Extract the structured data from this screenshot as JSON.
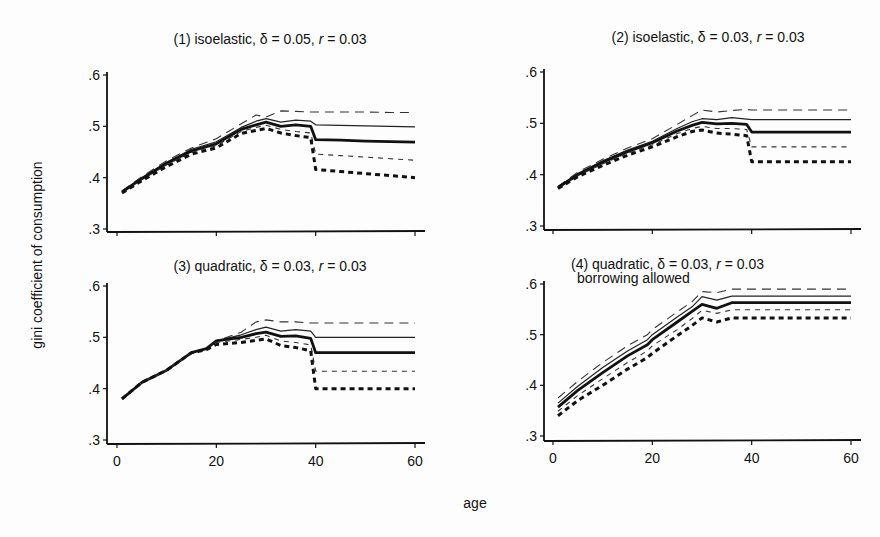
{
  "figure": {
    "ylabel": "gini coefficient of consumption",
    "xlabel": "age"
  },
  "chart_data": [
    {
      "type": "line",
      "title": "(1) isoelastic, δ = 0.05, r = 0.03",
      "title_parts": [
        "(1) isoelastic, δ = 0.05, ",
        "r",
        " = 0.03"
      ],
      "subtitle": "",
      "xlabel": "age",
      "ylabel": "gini coefficient of consumption",
      "xlim": [
        0,
        60
      ],
      "ylim": [
        0.3,
        0.6
      ],
      "xticks": [
        0,
        20,
        40,
        60
      ],
      "xtick_labels": [
        "",
        "",
        "",
        ""
      ],
      "yticks": [
        0.3,
        0.4,
        0.5,
        0.6
      ],
      "ytick_labels": [
        ".3",
        ".4",
        ".5",
        ".6"
      ],
      "grid": false,
      "x": [
        1,
        5,
        10,
        15,
        20,
        25,
        28,
        30,
        33,
        36,
        39,
        40,
        45,
        50,
        55,
        60
      ],
      "series": [
        {
          "name": "upper long dashed",
          "style": "longdash",
          "values": [
            0.374,
            0.402,
            0.433,
            0.458,
            0.476,
            0.505,
            0.522,
            0.518,
            0.53,
            0.529,
            0.528,
            0.528,
            0.528,
            0.528,
            0.527,
            0.527
          ]
        },
        {
          "name": "upper thin solid",
          "style": "thin",
          "values": [
            0.373,
            0.4,
            0.43,
            0.455,
            0.47,
            0.498,
            0.51,
            0.515,
            0.508,
            0.512,
            0.51,
            0.503,
            0.502,
            0.501,
            0.5,
            0.499
          ]
        },
        {
          "name": "median thick solid",
          "style": "thick",
          "values": [
            0.372,
            0.398,
            0.428,
            0.452,
            0.466,
            0.494,
            0.503,
            0.508,
            0.5,
            0.503,
            0.5,
            0.474,
            0.473,
            0.471,
            0.47,
            0.469
          ]
        },
        {
          "name": "lower thin dashed",
          "style": "dash",
          "values": [
            0.371,
            0.396,
            0.425,
            0.449,
            0.462,
            0.49,
            0.498,
            0.502,
            0.494,
            0.49,
            0.487,
            0.446,
            0.443,
            0.44,
            0.437,
            0.434
          ]
        },
        {
          "name": "lower thick dotted",
          "style": "thickdash",
          "values": [
            0.37,
            0.394,
            0.422,
            0.446,
            0.458,
            0.486,
            0.492,
            0.496,
            0.487,
            0.482,
            0.478,
            0.416,
            0.412,
            0.408,
            0.404,
            0.4
          ]
        }
      ]
    },
    {
      "type": "line",
      "title": "(2) isoelastic, δ = 0.03, r = 0.03",
      "title_parts": [
        "(2) isoelastic, δ = 0.03, ",
        "r",
        " = 0.03"
      ],
      "subtitle": "",
      "xlabel": "age",
      "ylabel": "gini coefficient of consumption",
      "xlim": [
        0,
        60
      ],
      "ylim": [
        0.3,
        0.6
      ],
      "xticks": [
        0,
        20,
        40,
        60
      ],
      "xtick_labels": [
        "",
        "",
        "",
        ""
      ],
      "yticks": [
        0.3,
        0.4,
        0.5,
        0.6
      ],
      "ytick_labels": [
        ".3",
        ".4",
        ".5",
        ".6"
      ],
      "grid": false,
      "x": [
        1,
        5,
        10,
        15,
        20,
        25,
        28,
        30,
        33,
        36,
        39,
        40,
        45,
        50,
        55,
        60
      ],
      "series": [
        {
          "name": "upper long dashed",
          "style": "longdash",
          "values": [
            0.377,
            0.405,
            0.43,
            0.452,
            0.47,
            0.498,
            0.515,
            0.526,
            0.522,
            0.525,
            0.527,
            0.526,
            0.526,
            0.526,
            0.526,
            0.526
          ]
        },
        {
          "name": "upper thin solid",
          "style": "thin",
          "values": [
            0.376,
            0.402,
            0.427,
            0.448,
            0.465,
            0.49,
            0.503,
            0.509,
            0.507,
            0.511,
            0.508,
            0.507,
            0.507,
            0.507,
            0.507,
            0.507
          ]
        },
        {
          "name": "median thick solid",
          "style": "thick",
          "values": [
            0.375,
            0.4,
            0.424,
            0.445,
            0.462,
            0.485,
            0.496,
            0.502,
            0.499,
            0.5,
            0.498,
            0.483,
            0.483,
            0.483,
            0.483,
            0.483
          ]
        },
        {
          "name": "lower thin dashed",
          "style": "dash",
          "values": [
            0.374,
            0.398,
            0.421,
            0.442,
            0.458,
            0.48,
            0.49,
            0.494,
            0.49,
            0.49,
            0.488,
            0.454,
            0.454,
            0.454,
            0.454,
            0.454
          ]
        },
        {
          "name": "lower thick dotted",
          "style": "thickdash",
          "values": [
            0.373,
            0.396,
            0.418,
            0.438,
            0.454,
            0.474,
            0.484,
            0.487,
            0.481,
            0.479,
            0.476,
            0.425,
            0.425,
            0.425,
            0.425,
            0.425
          ]
        }
      ]
    },
    {
      "type": "line",
      "title": "(3) quadratic, δ = 0.03, r = 0.03",
      "title_parts": [
        "(3) quadratic, δ = 0.03, ",
        "r",
        " = 0.03"
      ],
      "subtitle": "",
      "xlabel": "age",
      "ylabel": "gini coefficient of consumption",
      "xlim": [
        0,
        60
      ],
      "ylim": [
        0.3,
        0.6
      ],
      "xticks": [
        0,
        20,
        40,
        60
      ],
      "xtick_labels": [
        "0",
        "20",
        "40",
        "60"
      ],
      "yticks": [
        0.3,
        0.4,
        0.5,
        0.6
      ],
      "ytick_labels": [
        ".3",
        ".4",
        ".5",
        ".6"
      ],
      "grid": false,
      "x": [
        1,
        5,
        10,
        15,
        18,
        20,
        25,
        28,
        30,
        33,
        36,
        39,
        40,
        45,
        50,
        55,
        60
      ],
      "series": [
        {
          "name": "upper long dashed",
          "style": "longdash",
          "values": [
            0.38,
            0.412,
            0.436,
            0.47,
            0.478,
            0.493,
            0.51,
            0.53,
            0.534,
            0.53,
            0.53,
            0.528,
            0.528,
            0.528,
            0.528,
            0.528,
            0.528
          ]
        },
        {
          "name": "upper thin solid",
          "style": "thin",
          "values": [
            0.38,
            0.412,
            0.436,
            0.47,
            0.478,
            0.493,
            0.505,
            0.515,
            0.52,
            0.512,
            0.515,
            0.512,
            0.5,
            0.5,
            0.5,
            0.5,
            0.5
          ]
        },
        {
          "name": "median thick solid",
          "style": "thick",
          "values": [
            0.38,
            0.412,
            0.436,
            0.47,
            0.478,
            0.493,
            0.5,
            0.507,
            0.51,
            0.502,
            0.503,
            0.498,
            0.47,
            0.47,
            0.47,
            0.47,
            0.47
          ]
        },
        {
          "name": "lower thin dashed",
          "style": "dash",
          "values": [
            0.38,
            0.412,
            0.436,
            0.47,
            0.478,
            0.49,
            0.496,
            0.5,
            0.504,
            0.493,
            0.49,
            0.485,
            0.434,
            0.434,
            0.434,
            0.434,
            0.434
          ]
        },
        {
          "name": "lower thick dotted",
          "style": "thickdash",
          "values": [
            0.38,
            0.412,
            0.436,
            0.47,
            0.476,
            0.486,
            0.49,
            0.494,
            0.497,
            0.484,
            0.48,
            0.474,
            0.4,
            0.4,
            0.4,
            0.4,
            0.4
          ]
        }
      ]
    },
    {
      "type": "line",
      "title": "(4) quadratic, δ = 0.03, r = 0.03",
      "title_parts": [
        "(4) quadratic, δ = 0.03, ",
        "r",
        " = 0.03"
      ],
      "subtitle": "borrowing allowed",
      "xlabel": "age",
      "ylabel": "gini coefficient of consumption",
      "xlim": [
        0,
        60
      ],
      "ylim": [
        0.3,
        0.6
      ],
      "xticks": [
        0,
        20,
        40,
        60
      ],
      "xtick_labels": [
        "0",
        "20",
        "40",
        "60"
      ],
      "yticks": [
        0.3,
        0.4,
        0.5,
        0.6
      ],
      "ytick_labels": [
        ".3",
        ".4",
        ".5",
        ".6"
      ],
      "grid": false,
      "x": [
        1,
        5,
        10,
        15,
        19,
        20,
        25,
        28,
        30,
        33,
        36,
        40,
        45,
        50,
        55,
        60
      ],
      "series": [
        {
          "name": "upper long dashed",
          "style": "longdash",
          "values": [
            0.375,
            0.408,
            0.445,
            0.478,
            0.5,
            0.51,
            0.545,
            0.565,
            0.585,
            0.583,
            0.59,
            0.59,
            0.59,
            0.59,
            0.59,
            0.59
          ]
        },
        {
          "name": "upper thin solid",
          "style": "thin",
          "values": [
            0.365,
            0.398,
            0.435,
            0.468,
            0.49,
            0.5,
            0.535,
            0.555,
            0.575,
            0.568,
            0.576,
            0.576,
            0.576,
            0.576,
            0.576,
            0.576
          ]
        },
        {
          "name": "median thick solid",
          "style": "thick",
          "values": [
            0.357,
            0.39,
            0.425,
            0.458,
            0.48,
            0.49,
            0.525,
            0.546,
            0.56,
            0.552,
            0.563,
            0.563,
            0.563,
            0.563,
            0.563,
            0.563
          ]
        },
        {
          "name": "lower thin dashed",
          "style": "dash",
          "values": [
            0.349,
            0.38,
            0.413,
            0.445,
            0.468,
            0.478,
            0.51,
            0.532,
            0.548,
            0.542,
            0.549,
            0.549,
            0.549,
            0.549,
            0.549,
            0.549
          ]
        },
        {
          "name": "lower thick dotted",
          "style": "thickdash",
          "values": [
            0.34,
            0.37,
            0.4,
            0.432,
            0.455,
            0.463,
            0.498,
            0.518,
            0.533,
            0.525,
            0.533,
            0.533,
            0.533,
            0.533,
            0.533,
            0.533
          ]
        }
      ]
    }
  ]
}
